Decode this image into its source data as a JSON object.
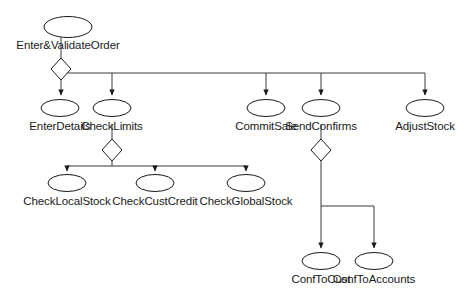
{
  "diagram": {
    "type": "task-decomposition-tree",
    "colors": {
      "stroke": "#1a1a1a",
      "fill": "#ffffff",
      "text": "#1a1a1a",
      "background": "#ffffff",
      "border": "#d8d8d8"
    },
    "nodes": [
      {
        "id": "enter_validate_order",
        "label": "Enter&ValidateOrder",
        "shape": "ellipse",
        "cx": 68,
        "cy": 27,
        "rx": 24,
        "ry": 10.5,
        "label_x": 68,
        "label_y": 39
      },
      {
        "id": "enter_details",
        "label": "EnterDetails",
        "shape": "ellipse",
        "cx": 60,
        "cy": 108,
        "rx": 19,
        "ry": 8.5,
        "label_x": 60,
        "label_y": 120
      },
      {
        "id": "check_limits",
        "label": "CheckLimits",
        "shape": "ellipse",
        "cx": 112,
        "cy": 108,
        "rx": 19,
        "ry": 8.5,
        "label_x": 112,
        "label_y": 120
      },
      {
        "id": "commit_sale",
        "label": "CommitSale",
        "shape": "ellipse",
        "cx": 266,
        "cy": 108,
        "rx": 19,
        "ry": 8.5,
        "label_x": 266,
        "label_y": 120
      },
      {
        "id": "send_confirms",
        "label": "SendConfirms",
        "shape": "ellipse",
        "cx": 321,
        "cy": 108,
        "rx": 19,
        "ry": 8.5,
        "label_x": 321,
        "label_y": 120
      },
      {
        "id": "adjust_stock",
        "label": "AdjustStock",
        "shape": "ellipse",
        "cx": 425,
        "cy": 108,
        "rx": 19,
        "ry": 8.5,
        "label_x": 425,
        "label_y": 120
      },
      {
        "id": "check_local_stock",
        "label": "CheckLocalStock",
        "shape": "ellipse",
        "cx": 67,
        "cy": 183,
        "rx": 19,
        "ry": 8.5,
        "label_x": 67,
        "label_y": 195
      },
      {
        "id": "check_cust_credit",
        "label": "CheckCustCredit",
        "shape": "ellipse",
        "cx": 155,
        "cy": 183,
        "rx": 19,
        "ry": 8.5,
        "label_x": 155,
        "label_y": 195
      },
      {
        "id": "check_global_stock",
        "label": "CheckGlobalStock",
        "shape": "ellipse",
        "cx": 246,
        "cy": 183,
        "rx": 19,
        "ry": 8.5,
        "label_x": 246,
        "label_y": 195
      },
      {
        "id": "conf_to_cust",
        "label": "ConfToCust",
        "shape": "ellipse",
        "cx": 321,
        "cy": 261,
        "rx": 19,
        "ry": 8.5,
        "label_x": 321,
        "label_y": 273
      },
      {
        "id": "conf_to_accounts",
        "label": "ConfToAccounts",
        "shape": "ellipse",
        "cx": 374,
        "cy": 261,
        "rx": 19,
        "ry": 8.5,
        "label_x": 374,
        "label_y": 273
      }
    ],
    "decision_diamonds": [
      {
        "id": "root-decomposition-diamond",
        "cx": 61,
        "cy": 69,
        "rx": 10,
        "ry": 11
      },
      {
        "id": "check-limits-decomposition-diamond",
        "cx": 112,
        "cy": 150,
        "rx": 10,
        "ry": 11
      },
      {
        "id": "send-confirms-decomposition-diamond",
        "cx": 321,
        "cy": 150,
        "rx": 10,
        "ry": 11
      }
    ],
    "edges": [
      {
        "id": "root-to-diamond",
        "from": "enter_validate_order",
        "to": "root-decomposition-diamond"
      },
      {
        "id": "root-fork-to-enter-details",
        "from": "root-decomposition-diamond",
        "to": "enter_details"
      },
      {
        "id": "root-fork-to-check-limits",
        "from": "root-decomposition-diamond",
        "to": "check_limits"
      },
      {
        "id": "root-fork-to-commit-sale",
        "from": "root-decomposition-diamond",
        "to": "commit_sale"
      },
      {
        "id": "root-fork-to-send-confirms",
        "from": "root-decomposition-diamond",
        "to": "send_confirms"
      },
      {
        "id": "root-fork-to-adjust-stock",
        "from": "root-decomposition-diamond",
        "to": "adjust_stock"
      },
      {
        "id": "check-limits-to-diamond",
        "from": "check_limits",
        "to": "check-limits-decomposition-diamond"
      },
      {
        "id": "check-limits-fork-to-check-local-stock",
        "from": "check-limits-decomposition-diamond",
        "to": "check_local_stock"
      },
      {
        "id": "check-limits-fork-to-check-cust-credit",
        "from": "check-limits-decomposition-diamond",
        "to": "check_cust_credit"
      },
      {
        "id": "check-limits-fork-to-check-global-stock",
        "from": "check-limits-decomposition-diamond",
        "to": "check_global_stock"
      },
      {
        "id": "send-confirms-to-diamond",
        "from": "send_confirms",
        "to": "send-confirms-decomposition-diamond"
      },
      {
        "id": "send-confirms-fork-to-conf-to-cust",
        "from": "send-confirms-decomposition-diamond",
        "to": "conf_to_cust"
      },
      {
        "id": "send-confirms-fork-to-conf-to-accounts",
        "from": "send-confirms-decomposition-diamond",
        "to": "conf_to_accounts"
      }
    ]
  }
}
